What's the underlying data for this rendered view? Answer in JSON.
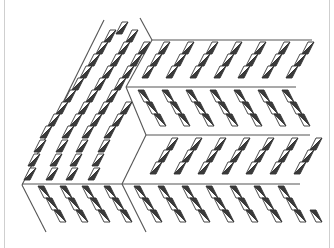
{
  "image": {
    "description": "Line-art illustration of a tessellated pattern: rhombus tiles split diagonally into a dark and a light triangle, arranged in sheared panels separated by thin lines",
    "width": 334,
    "height": 248
  },
  "colors": {
    "background": "#ffffff",
    "frame": "#cfcfcf",
    "line": "#555555",
    "dark_fill": "#3a3a3a",
    "light_fill": "#ffffff",
    "outline": "#333333"
  },
  "lines": [
    {
      "x1": 104,
      "y1": 20,
      "x2": 22,
      "y2": 185
    },
    {
      "x1": 22,
      "y1": 185,
      "x2": 46,
      "y2": 232
    },
    {
      "x1": 140,
      "y1": 18,
      "x2": 152,
      "y2": 40
    },
    {
      "x1": 152,
      "y1": 40,
      "x2": 126,
      "y2": 87
    },
    {
      "x1": 126,
      "y1": 87,
      "x2": 146,
      "y2": 135
    },
    {
      "x1": 146,
      "y1": 135,
      "x2": 122,
      "y2": 184
    },
    {
      "x1": 122,
      "y1": 184,
      "x2": 146,
      "y2": 232
    },
    {
      "x1": 152,
      "y1": 40,
      "x2": 312,
      "y2": 40
    },
    {
      "x1": 126,
      "y1": 87,
      "x2": 296,
      "y2": 87
    },
    {
      "x1": 146,
      "y1": 135,
      "x2": 310,
      "y2": 135
    },
    {
      "x1": 22,
      "y1": 184,
      "x2": 300,
      "y2": 184
    }
  ],
  "panels": [
    {
      "name": "left-slab",
      "orientation": "up",
      "rows": [
        {
          "y": 28,
          "xs": [
            118
          ]
        },
        {
          "y": 36,
          "xs": [
            106,
            128
          ]
        },
        {
          "y": 48,
          "xs": [
            98,
            120,
            140
          ]
        },
        {
          "y": 60,
          "xs": [
            90,
            112,
            132
          ]
        },
        {
          "y": 72,
          "xs": [
            82,
            104,
            124
          ]
        },
        {
          "y": 84,
          "xs": [
            74,
            96,
            116
          ]
        },
        {
          "y": 96,
          "xs": [
            66,
            88,
            108
          ]
        },
        {
          "y": 108,
          "xs": [
            58,
            80,
            100,
            122
          ]
        },
        {
          "y": 120,
          "xs": [
            50,
            72,
            92,
            114
          ]
        },
        {
          "y": 132,
          "xs": [
            42,
            64,
            84,
            106
          ]
        },
        {
          "y": 146,
          "xs": [
            36,
            58,
            78,
            100
          ]
        },
        {
          "y": 160,
          "xs": [
            30,
            52,
            72,
            94
          ]
        },
        {
          "y": 174,
          "xs": [
            26,
            48,
            68,
            90
          ]
        }
      ]
    },
    {
      "name": "right-band-1",
      "orientation": "up",
      "rows": [
        {
          "y": 48,
          "xs": [
            160,
            184,
            208,
            232,
            256,
            280,
            304
          ]
        },
        {
          "y": 60,
          "xs": [
            152,
            176,
            200,
            224,
            248,
            272,
            296
          ]
        },
        {
          "y": 72,
          "xs": [
            144,
            168,
            192,
            216,
            240,
            264,
            288
          ]
        }
      ]
    },
    {
      "name": "right-band-2",
      "orientation": "down",
      "rows": [
        {
          "y": 96,
          "xs": [
            140,
            164,
            188,
            212,
            236,
            260,
            284
          ]
        },
        {
          "y": 108,
          "xs": [
            148,
            172,
            196,
            220,
            244,
            268,
            292
          ]
        },
        {
          "y": 120,
          "xs": [
            156,
            180,
            204,
            228,
            252,
            276,
            300
          ]
        }
      ]
    },
    {
      "name": "right-band-3",
      "orientation": "up",
      "rows": [
        {
          "y": 144,
          "xs": [
            168,
            192,
            216,
            240,
            264,
            288,
            312
          ]
        },
        {
          "y": 156,
          "xs": [
            160,
            184,
            208,
            232,
            256,
            280,
            304
          ]
        },
        {
          "y": 168,
          "xs": [
            152,
            176,
            200,
            224,
            248,
            272,
            296
          ]
        }
      ]
    },
    {
      "name": "bottom-left",
      "orientation": "down",
      "rows": [
        {
          "y": 192,
          "xs": [
            40,
            62,
            84,
            106
          ]
        },
        {
          "y": 204,
          "xs": [
            48,
            70,
            92,
            114
          ]
        },
        {
          "y": 216,
          "xs": [
            56,
            78,
            100,
            122
          ]
        }
      ]
    },
    {
      "name": "bottom-right",
      "orientation": "down",
      "rows": [
        {
          "y": 192,
          "xs": [
            136,
            160,
            184,
            208,
            232,
            256,
            280
          ]
        },
        {
          "y": 204,
          "xs": [
            144,
            168,
            192,
            216,
            240,
            264,
            288
          ]
        },
        {
          "y": 216,
          "xs": [
            152,
            176,
            200,
            224,
            248,
            272,
            296,
            312
          ]
        }
      ]
    }
  ]
}
